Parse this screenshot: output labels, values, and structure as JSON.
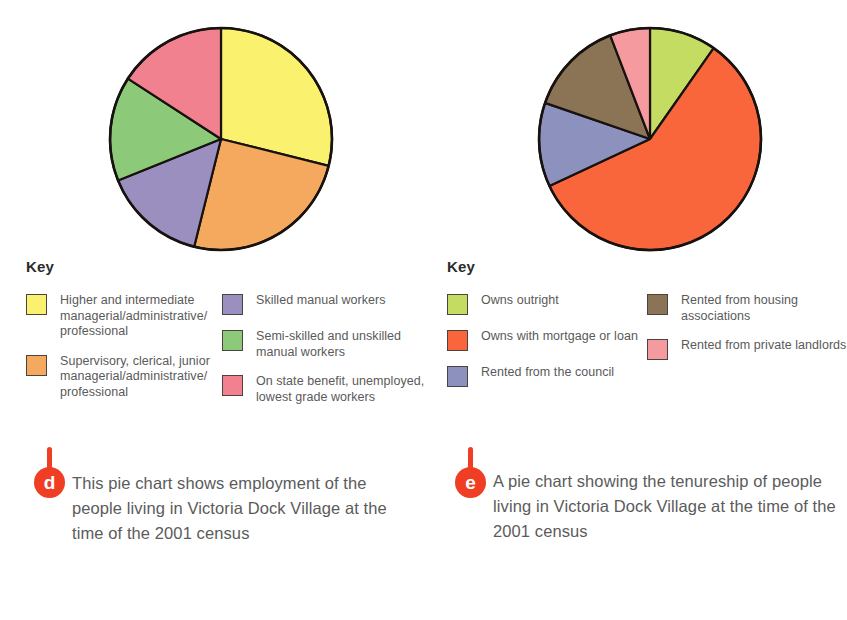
{
  "top_strip_text": "",
  "chart_data": [
    {
      "type": "pie",
      "id": "employment-pie",
      "title": "",
      "key_title": "Key",
      "legend_position": "below",
      "categories": [
        "Higher and intermediate managerial/administrative/ professional",
        "Supervisory, clerical, junior managerial/administrative/ professional",
        "Skilled manual workers",
        "Semi-skilled and unskilled manual workers",
        "On state benefit, unemployed, lowest grade workers"
      ],
      "values": [
        29,
        25,
        15,
        15,
        16
      ],
      "colors": [
        "#faf26e",
        "#f5a95e",
        "#9b8fc0",
        "#8cc978",
        "#f2818f"
      ],
      "start_angle_deg": 0,
      "slice_angles_deg": [
        104,
        90,
        54,
        55,
        57
      ],
      "caption_marker": "d",
      "caption": "This pie chart shows employment of the people living in Victoria Dock Village at the time of the 2001 census"
    },
    {
      "type": "pie",
      "id": "tenureship-pie",
      "title": "",
      "key_title": "Key",
      "legend_position": "below",
      "categories": [
        "Owns outright",
        "Owns with mortgage or loan",
        "Rented from the council",
        "Rented from housing associations",
        "Rented from private landlords"
      ],
      "values": [
        10,
        58,
        12,
        14,
        6
      ],
      "colors": [
        "#c5dc62",
        "#f9663c",
        "#8c91be",
        "#8b7355",
        "#f59a9e"
      ],
      "start_angle_deg": 0,
      "slice_angles_deg": [
        35,
        210,
        44,
        50,
        21
      ],
      "caption_marker": "e",
      "caption": "A pie chart showing the tenureship of people living in Victoria Dock Village at the time of the 2001 census"
    }
  ],
  "left": {
    "key_title": "Key",
    "legend_col1": [
      {
        "color": "#faf26e",
        "label": "Higher and intermediate managerial/administrative/ professional"
      },
      {
        "color": "#f5a95e",
        "label": "Supervisory, clerical, junior managerial/administrative/ professional"
      }
    ],
    "legend_col2": [
      {
        "color": "#9b8fc0",
        "label": "Skilled manual workers"
      },
      {
        "color": "#8cc978",
        "label": "Semi-skilled and unskilled manual workers"
      },
      {
        "color": "#f2818f",
        "label": "On state benefit, unemployed, lowest grade workers"
      }
    ],
    "marker": "d",
    "caption": "This pie chart shows employment of the people living in Victoria Dock Village at the time of the 2001 census"
  },
  "right": {
    "key_title": "Key",
    "legend_col1": [
      {
        "color": "#c5dc62",
        "label": "Owns outright"
      },
      {
        "color": "#f9663c",
        "label": "Owns with mortgage or loan"
      },
      {
        "color": "#8c91be",
        "label": "Rented from the council"
      }
    ],
    "legend_col2": [
      {
        "color": "#8b7355",
        "label": "Rented from housing associations"
      },
      {
        "color": "#f59a9e",
        "label": "Rented from private landlords"
      }
    ],
    "marker": "e",
    "caption": "A pie chart showing the tenureship of people living in Victoria Dock Village at the time of the 2001 census"
  }
}
